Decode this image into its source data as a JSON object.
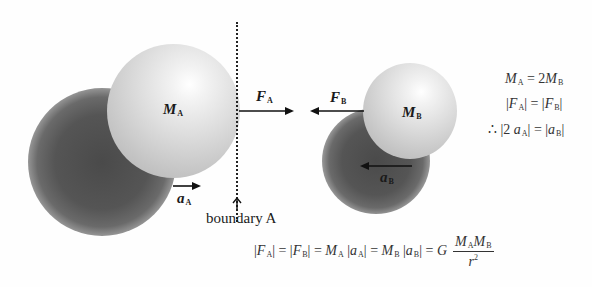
{
  "diagram": {
    "mass_a": {
      "symbol": "M",
      "sub": "A"
    },
    "mass_b": {
      "symbol": "M",
      "sub": "B"
    },
    "force_a": {
      "symbol": "F",
      "sub": "A",
      "direction": "right"
    },
    "force_b": {
      "symbol": "F",
      "sub": "B",
      "direction": "left"
    },
    "accel_a": {
      "symbol": "a",
      "sub": "A",
      "direction": "right"
    },
    "accel_b": {
      "symbol": "a",
      "sub": "B",
      "direction": "left"
    },
    "boundary_label": "boundary A"
  },
  "side_equations": {
    "line1": {
      "lhs": "M",
      "lhs_sub": "A",
      "op": " = 2",
      "rhs": "M",
      "rhs_sub": "B"
    },
    "line2": {
      "l_open": "|",
      "lhs": "F",
      "lhs_sub": "A",
      "mid": "| = |",
      "rhs": "F",
      "rhs_sub": "B",
      "r_close": "|"
    },
    "line3": {
      "prefix": "∴ |2 ",
      "lhs": "a",
      "lhs_sub": "A",
      "mid": "| = |",
      "rhs": "a",
      "rhs_sub": "B",
      "r_close": "|"
    }
  },
  "main_equation": {
    "t1": "|",
    "f1": "F",
    "f1s": "A",
    "t2": "| = |",
    "f2": "F",
    "f2s": "B",
    "t3": "| = ",
    "m1": "M",
    "m1s": "A",
    "t4": " |",
    "a1": "a",
    "a1s": "A",
    "t5": "| = ",
    "m2": "M",
    "m2s": "B",
    "t6": " |",
    "a2": "a",
    "a2s": "B",
    "t7": "| = ",
    "g": "G",
    "num_m1": "M",
    "num_m1s": "A",
    "num_m2": "M",
    "num_m2s": "B",
    "den": "r",
    "den_exp": "2"
  }
}
